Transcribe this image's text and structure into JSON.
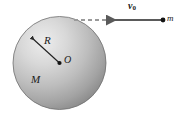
{
  "figure": {
    "background_color": "#ffffff",
    "sphere": {
      "body_label": "M",
      "radius_label": "R",
      "center_label": "O",
      "fill_light": "#e8e8e8",
      "fill_mid": "#b4b4b4",
      "fill_dark": "#8a8a8a",
      "outline_color": "#6e6e6e"
    },
    "particle": {
      "mass_label": "m",
      "dot_color": "#1a1a1a"
    },
    "velocity": {
      "symbol": "v",
      "subscript": "0",
      "arrow_color": "#5a5a5a",
      "dashed_color": "#9a9a9a",
      "direction": "left"
    }
  }
}
